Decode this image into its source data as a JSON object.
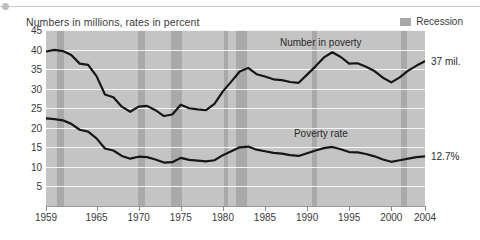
{
  "header": {
    "title": "Numbers in millions, rates in percent",
    "legend": {
      "label": "Recession",
      "swatch_color": "#a8a8a8"
    }
  },
  "callouts": {
    "number_in_poverty": "37 mil.",
    "poverty_rate": "12.7%"
  },
  "series_labels": {
    "number_in_poverty": "Number in poverty",
    "poverty_rate": "Poverty rate"
  },
  "colors": {
    "plot_background": "#c4c4c4",
    "recession_band": "#a9a9a9",
    "gridline": "#ffffff",
    "line": "#161616",
    "text": "#3a3a3a"
  },
  "chart_data": {
    "type": "line",
    "title": "Numbers in millions, rates in percent",
    "xlabel": "",
    "ylabel": "",
    "xlim": [
      1959,
      2004
    ],
    "ylim": [
      0,
      45
    ],
    "grid": true,
    "legend_position": "top-right",
    "ytick_labels": [
      "45",
      "40",
      "35",
      "30",
      "25",
      "20",
      "15",
      "10",
      "5"
    ],
    "yticks": [
      45,
      40,
      35,
      30,
      25,
      20,
      15,
      10,
      5
    ],
    "xtick_labels": [
      "1959",
      "1965",
      "1970",
      "1975",
      "1980",
      "1985",
      "1990",
      "1995",
      "2000",
      "2004"
    ],
    "xticks": [
      1959,
      1965,
      1970,
      1975,
      1980,
      1985,
      1990,
      1995,
      2000,
      2004
    ],
    "x": [
      1959,
      1960,
      1961,
      1962,
      1963,
      1964,
      1965,
      1966,
      1967,
      1968,
      1969,
      1970,
      1971,
      1972,
      1973,
      1974,
      1975,
      1976,
      1977,
      1978,
      1979,
      1980,
      1981,
      1982,
      1983,
      1984,
      1985,
      1986,
      1987,
      1988,
      1989,
      1990,
      1991,
      1992,
      1993,
      1994,
      1995,
      1996,
      1997,
      1998,
      1999,
      2000,
      2001,
      2002,
      2003,
      2004
    ],
    "series": [
      {
        "name": "Number in poverty",
        "units": "millions",
        "end_label": "37 mil.",
        "values": [
          39.5,
          39.9,
          39.6,
          38.6,
          36.4,
          36.1,
          33.2,
          28.5,
          27.8,
          25.4,
          24.1,
          25.4,
          25.6,
          24.5,
          23.0,
          23.4,
          25.9,
          25.0,
          24.7,
          24.5,
          26.1,
          29.3,
          31.8,
          34.4,
          35.3,
          33.7,
          33.1,
          32.4,
          32.2,
          31.7,
          31.5,
          33.6,
          35.7,
          38.0,
          39.3,
          38.1,
          36.4,
          36.5,
          35.6,
          34.5,
          32.8,
          31.6,
          32.9,
          34.6,
          35.9,
          37.0
        ]
      },
      {
        "name": "Poverty rate",
        "units": "percent",
        "end_label": "12.7%",
        "values": [
          22.4,
          22.2,
          21.9,
          21.0,
          19.5,
          19.0,
          17.3,
          14.7,
          14.2,
          12.8,
          12.1,
          12.6,
          12.5,
          11.9,
          11.1,
          11.2,
          12.3,
          11.8,
          11.6,
          11.4,
          11.7,
          13.0,
          14.0,
          15.0,
          15.2,
          14.4,
          14.0,
          13.6,
          13.4,
          13.0,
          12.8,
          13.5,
          14.2,
          14.8,
          15.1,
          14.5,
          13.8,
          13.7,
          13.3,
          12.7,
          11.9,
          11.3,
          11.7,
          12.1,
          12.5,
          12.7
        ]
      }
    ],
    "recession_bands": [
      {
        "start": 1960.3,
        "end": 1961.1
      },
      {
        "start": 1969.9,
        "end": 1970.8
      },
      {
        "start": 1973.9,
        "end": 1975.2
      },
      {
        "start": 1980.1,
        "end": 1980.6
      },
      {
        "start": 1981.5,
        "end": 1982.9
      },
      {
        "start": 1990.6,
        "end": 1991.2
      },
      {
        "start": 2001.2,
        "end": 2001.9
      }
    ],
    "annotations": [
      {
        "text": "Number in poverty",
        "x": 1992,
        "y": 41.5
      },
      {
        "text": "Poverty rate",
        "x": 1992,
        "y": 18.2
      },
      {
        "text": "37 mil.",
        "x": 2005.5,
        "y": 37.0
      },
      {
        "text": "12.7%",
        "x": 2005.5,
        "y": 12.7
      }
    ]
  }
}
